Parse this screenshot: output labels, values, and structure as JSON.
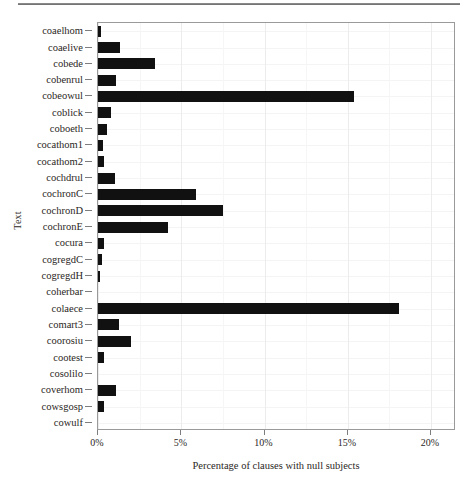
{
  "figure": {
    "top_rule": "horizontal-rule"
  },
  "chart_data": {
    "type": "bar",
    "orientation": "horizontal",
    "title": "",
    "xlabel": "Percentage of clauses with null subjects",
    "ylabel": "Text",
    "xlim": [
      0,
      21.5
    ],
    "grid": true,
    "legend": null,
    "xticks": [
      0,
      5,
      10,
      15,
      20
    ],
    "xtick_labels": [
      "0%",
      "5%",
      "10%",
      "15%",
      "20%"
    ],
    "categories": [
      "coaelhom",
      "coaelive",
      "cobede",
      "cobenrul",
      "cobeowul",
      "coblick",
      "coboeth",
      "cocathom1",
      "cocathom2",
      "cochdrul",
      "cochronC",
      "cochronD",
      "cochronE",
      "cocura",
      "cogregdC",
      "cogregdH",
      "coherbar",
      "colaece",
      "comart3",
      "coorosiu",
      "cootest",
      "cosolilo",
      "coverhom",
      "cowsgosp",
      "cowulf"
    ],
    "values": [
      0.2,
      1.3,
      3.4,
      1.1,
      15.4,
      0.8,
      0.55,
      0.3,
      0.35,
      1.0,
      5.9,
      7.5,
      4.2,
      0.35,
      0.25,
      0.1,
      0.0,
      18.1,
      1.25,
      2.0,
      0.35,
      0.0,
      1.1,
      0.35,
      0.0
    ],
    "bar_color": "#111111",
    "panel_border_color": "#9a9a9a",
    "grid_color": "#ececec"
  }
}
